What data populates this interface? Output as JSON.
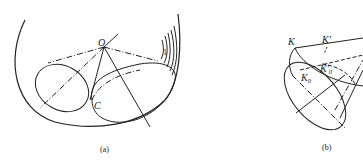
{
  "figure": {
    "panels": [
      {
        "id": "a",
        "caption": "(a)",
        "labels": {
          "apex": "O",
          "contact": "C",
          "marker": "1"
        }
      },
      {
        "id": "b",
        "caption": "(b)",
        "labels": {
          "k": "K",
          "k_prime": "K'",
          "k0": "K",
          "k0_sub": "0",
          "k0_prime": "K'",
          "k0_prime_sub": "0"
        }
      }
    ],
    "stroke_color": "#222222",
    "background": "#ffffff"
  }
}
